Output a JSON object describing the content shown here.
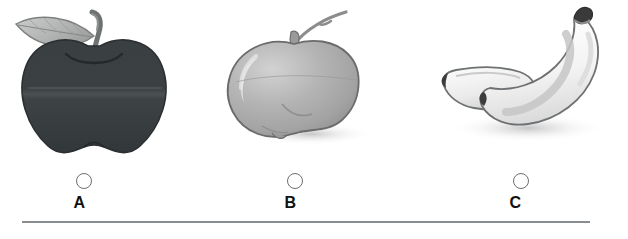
{
  "question": {
    "type": "multiple-choice-image",
    "options": [
      {
        "letter": "A",
        "image_name": "dark-apple-with-leaf",
        "selected": false,
        "colors": {
          "body": "#3c4144",
          "leaf": "#b9bbbb",
          "stem": "#6a6d6e",
          "outline": "#2a2d2f"
        }
      },
      {
        "letter": "B",
        "image_name": "light-gray-apple",
        "selected": false,
        "colors": {
          "body": "#adadad",
          "highlight": "#cfcfcf",
          "stem": "#8a8a8a",
          "outline": "#6b6b6b"
        }
      },
      {
        "letter": "C",
        "image_name": "banana-pair",
        "selected": false,
        "colors": {
          "body": "#f2f2f2",
          "shade": "#c9c9c9",
          "tip": "#3a3a3a",
          "outline": "#6e6e6e"
        }
      }
    ]
  },
  "divider": {
    "color": "#8a8d90"
  },
  "background": {
    "color": "#ffffff"
  }
}
